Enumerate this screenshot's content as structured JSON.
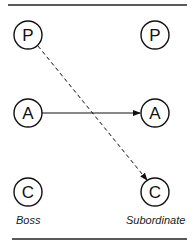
{
  "diagram": {
    "type": "transactional-analysis-transaction",
    "columns": [
      {
        "label": "Boss",
        "states": [
          "P",
          "A",
          "C"
        ]
      },
      {
        "label": "Subordinate",
        "states": [
          "P",
          "A",
          "C"
        ]
      }
    ],
    "edges": [
      {
        "from": "Boss.P",
        "to": "Subordinate.C",
        "style": "dashed"
      },
      {
        "from": "Boss.A",
        "to": "Subordinate.A",
        "style": "solid"
      }
    ]
  },
  "labels": {
    "left": "Boss",
    "right": "Subordinate"
  },
  "nodes": {
    "left_p": "P",
    "left_a": "A",
    "left_c": "C",
    "right_p": "P",
    "right_a": "A",
    "right_c": "C"
  },
  "colors": {
    "ink": "#111111",
    "background": "#ffffff"
  }
}
